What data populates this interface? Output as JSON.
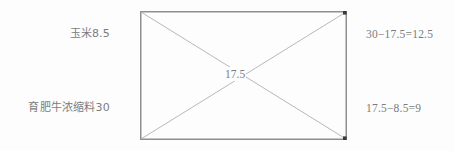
{
  "diagram": {
    "type": "pearson-square",
    "colors": {
      "border": "#8f8f8f",
      "diagonal": "#b0b0b0",
      "text": "#7c7c7c",
      "marker": "#3a3a3a",
      "background": "#fdfdfd"
    },
    "center": {
      "label": "17.5",
      "value": 17.5
    },
    "left_labels": [
      {
        "name": "corn-label",
        "text": "玉米8.5",
        "ingredient": "玉米",
        "value": 8.5
      },
      {
        "name": "concentrate-label",
        "text": "育肥牛浓缩料30",
        "ingredient": "育肥牛浓缩料",
        "value": 30
      }
    ],
    "right_labels": [
      {
        "name": "corn-parts-calc",
        "text": "30−17.5=12.5",
        "result": 12.5
      },
      {
        "name": "concentrate-parts-calc",
        "text": "17.5−8.5=9",
        "result": 9
      }
    ],
    "corner_markers": [
      {
        "name": "marker-top-right",
        "position": "top-right"
      },
      {
        "name": "marker-bottom-right",
        "position": "bottom-right"
      }
    ]
  }
}
